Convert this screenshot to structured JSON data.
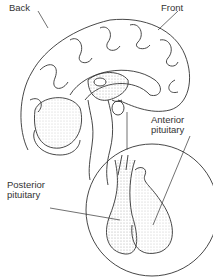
{
  "labels": {
    "back": "Back",
    "front": "Front",
    "anterior": [
      "Anterior",
      "pituitary"
    ],
    "posterior": [
      "Posterior",
      "pituitary"
    ]
  },
  "colors": {
    "line": "#333333",
    "stipple": "#b8b8b8",
    "background": "#ffffff"
  }
}
